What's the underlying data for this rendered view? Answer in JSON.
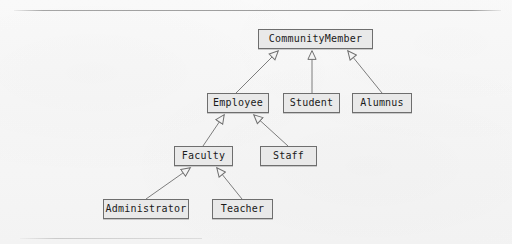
{
  "diagram": {
    "kind": "uml-class-diagram",
    "relationship": "generalization",
    "background_color": "#f8f8f8",
    "box_fill_color": "#e9e9e9",
    "box_border_color": "#6e6e6e",
    "line_color": "#7a7a7a",
    "text_color": "#1a1a1a",
    "classes": [
      {
        "id": "communitymember",
        "label": "CommunityMember",
        "x": 258,
        "y": 29,
        "w": 115,
        "h": 20,
        "level": 0
      },
      {
        "id": "employee",
        "label": "Employee",
        "x": 207,
        "y": 93,
        "w": 62,
        "h": 20,
        "level": 1
      },
      {
        "id": "student",
        "label": "Student",
        "x": 283,
        "y": 93,
        "w": 57,
        "h": 20,
        "level": 1
      },
      {
        "id": "alumnus",
        "label": "Alumnus",
        "x": 352,
        "y": 93,
        "w": 60,
        "h": 20,
        "level": 1
      },
      {
        "id": "faculty",
        "label": "Faculty",
        "x": 174,
        "y": 146,
        "w": 59,
        "h": 20,
        "level": 2
      },
      {
        "id": "staff",
        "label": "Staff",
        "x": 260,
        "y": 146,
        "w": 57,
        "h": 20,
        "level": 2
      },
      {
        "id": "administrator",
        "label": "Administrator",
        "x": 103,
        "y": 199,
        "w": 86,
        "h": 20,
        "level": 3
      },
      {
        "id": "teacher",
        "label": "Teacher",
        "x": 212,
        "y": 199,
        "w": 61,
        "h": 20,
        "level": 3
      }
    ],
    "generalizations": [
      {
        "from": "employee",
        "to": "communitymember",
        "arrow": "hollow-triangle"
      },
      {
        "from": "student",
        "to": "communitymember",
        "arrow": "hollow-triangle"
      },
      {
        "from": "alumnus",
        "to": "communitymember",
        "arrow": "hollow-triangle"
      },
      {
        "from": "faculty",
        "to": "employee",
        "arrow": "hollow-triangle"
      },
      {
        "from": "staff",
        "to": "employee",
        "arrow": "hollow-triangle"
      },
      {
        "from": "administrator",
        "to": "faculty",
        "arrow": "hollow-triangle"
      },
      {
        "from": "teacher",
        "to": "faculty",
        "arrow": "hollow-triangle"
      }
    ],
    "rules": [
      {
        "id": "rule-top",
        "x": 14,
        "y": 10,
        "w": 487
      },
      {
        "id": "rule-bottom",
        "x": 20,
        "y": 238,
        "w": 182
      }
    ]
  }
}
